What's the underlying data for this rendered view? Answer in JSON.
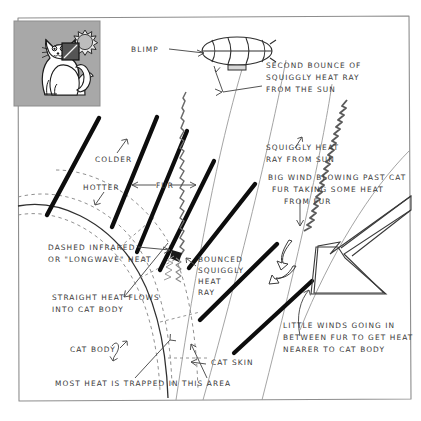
{
  "diagram": {
    "title_absent": true,
    "frame_color": "#8d8d8d",
    "ink_color": "#333333",
    "fur_color": "#0d0d0d",
    "inset_bg": "#a8a8a8",
    "inset_callout_fill": "#555555"
  },
  "inset": {
    "name": "cat-with-sun-inset",
    "cat_label": "cat",
    "sun_label": "sun",
    "callout_label": "magnified-fur-region"
  },
  "labels": {
    "blimp": "BLIMP",
    "second_bounce": "SECOND BOUNCE OF SQUIGGLY HEAT RAY FROM THE SUN",
    "second_bounce_lines": [
      "SECOND  BOUNCE  OF",
      "SQUIGGLY  HEAT  RAY",
      "FROM  THE  SUN"
    ],
    "squiggly_ray": "SQUIGGLY HEAT RAY FROM SUN",
    "squiggly_ray_lines": [
      "SQUIGGLY  HEAT",
      "RAY FROM SUN"
    ],
    "big_wind": "BIG WIND BLOWING PAST CAT FUR TAKING SOME HEAT FROM FUR",
    "big_wind_lines": [
      "BIG  WIND  BLOWING  PAST  CAT",
      "FUR  TAKING  SOME  HEAT",
      "FROM   FUR"
    ],
    "colder": "COLDER",
    "hotter": "HOTTER",
    "fur": "FUR",
    "dashed_infrared": "DASHED INFRARED OR \"LONGWAVE\" HEAT",
    "dashed_infrared_lines": [
      "DASHED  INFRARED",
      "OR  \"LONGWAVE\"  HEAT"
    ],
    "bounced_ray": "BOUNCED SQUIGGLY HEAT RAY",
    "bounced_ray_lines": [
      "BOUNCED",
      "SQUIGGLY",
      "HEAT",
      "RAY"
    ],
    "straight_heat": "STRAIGHT HEAT FLOWS INTO CAT BODY",
    "straight_heat_lines": [
      "STRAIGHT  HEAT  FLOWS",
      "INTO  CAT  BODY"
    ],
    "little_winds": "LITTLE WINDS GOING IN BETWEEN FUR TO GET HEAT NEARER TO CAT BODY",
    "little_winds_lines": [
      "LITTLE   WINDS  GOING  IN",
      "BETWEEN  FUR  TO  GET  HEAT",
      "NEARER  TO  CAT  BODY"
    ],
    "cat_body": "CAT BODY",
    "cat_skin": "CAT SKIN",
    "most_heat": "MOST  HEAT  IS  TRAPPED  IN  THIS  AREA"
  },
  "icons": {
    "blimp": "blimp-icon",
    "sun": "sun-icon",
    "cat": "cat-icon",
    "big_wind_arrow": "big-hollow-arrow-icon",
    "little_wind_arrow": "small-curved-hollow-arrow-icon",
    "pointer_arrow": "pointer-arrow-icon"
  }
}
